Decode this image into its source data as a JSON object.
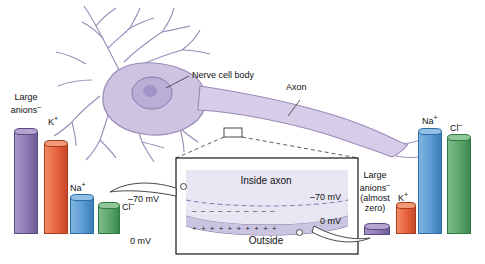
{
  "figure": {
    "title_absent": true,
    "labels": {
      "nerve_cell_body": "Nerve cell body",
      "axon": "Axon",
      "inside_axon": "Inside axon",
      "outside": "Outside",
      "large_anions_left_1": "Large",
      "large_anions_left_2": "anions",
      "large_anions_left_sup": "–",
      "k_left": "K",
      "k_left_sup": "+",
      "na_left": "Na",
      "na_left_sup": "+",
      "cl_left": "Cl",
      "cl_left_sup": "–",
      "na_right": "Na",
      "na_right_sup": "+",
      "cl_right": "Cl",
      "cl_right_sup": "–",
      "k_right": "K",
      "k_right_sup": "+",
      "large_anions_right_1": "Large",
      "large_anions_right_2": "anions",
      "large_anions_right_sup": "–",
      "large_anions_right_3": "(almost",
      "large_anions_right_4": "zero)",
      "voltage_inner_top": "–70 mV",
      "voltage_outer_top": "–70 mV",
      "voltage_inner_bottom": "0 mV",
      "voltage_outer_bottom": "0 mV"
    },
    "membrane_charges": {
      "inside_row": "–  –  –  –  –  –  –  –  –  –",
      "outside_row": "+  +  +  +  +  +  +  +  +  +"
    },
    "bars_left": [
      {
        "name": "large-anions",
        "label": "Large anions",
        "color": "#8d79b4",
        "edge": "#5c4a84",
        "x": 14,
        "w": 22,
        "h": 100
      },
      {
        "name": "potassium",
        "label": "K+",
        "color": "#e8613a",
        "edge": "#a93c1c",
        "x": 44,
        "w": 22,
        "h": 88
      },
      {
        "name": "sodium",
        "label": "Na+",
        "color": "#5b9bd5",
        "edge": "#2e6da4",
        "x": 70,
        "w": 22,
        "h": 34
      },
      {
        "name": "chloride",
        "label": "Cl-",
        "color": "#5aa469",
        "edge": "#2f7a42",
        "x": 98,
        "w": 20,
        "h": 26
      }
    ],
    "bars_right": [
      {
        "name": "sodium",
        "label": "Na+",
        "color": "#5b9bd5",
        "edge": "#2e6da4",
        "x": 418,
        "w": 22,
        "h": 100
      },
      {
        "name": "chloride",
        "label": "Cl-",
        "color": "#5aa469",
        "edge": "#2f7a42",
        "x": 447,
        "w": 22,
        "h": 94
      },
      {
        "name": "potassium",
        "label": "K+",
        "color": "#e8613a",
        "edge": "#a93c1c",
        "x": 396,
        "w": 18,
        "h": 26
      },
      {
        "name": "large-anions",
        "label": "Large anions",
        "color": "#8d79b4",
        "edge": "#5c4a84",
        "x": 366,
        "w": 22,
        "h": 7
      }
    ],
    "colors": {
      "cell_body": "#cfc3e2",
      "cell_edge": "#9a8ab8",
      "nucleus": "#b9aed6",
      "axon": "#d7cde8",
      "box_border": "#000000",
      "inside_fill": "#e9e6f3",
      "membrane": "#cbc4e0"
    }
  }
}
